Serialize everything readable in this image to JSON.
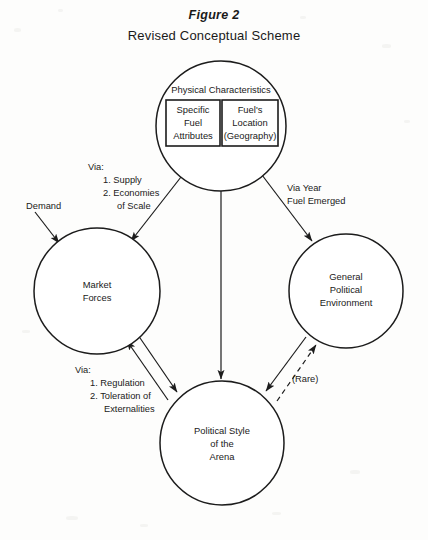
{
  "figure": {
    "label": "Figure 2",
    "subtitle": "Revised Conceptual Scheme"
  },
  "nodes": {
    "physical_characteristics": {
      "heading": "Physical Characteristics",
      "boxes": [
        {
          "lines": [
            "Specific",
            "Fuel",
            "Attributes"
          ]
        },
        {
          "lines": [
            "Fuel's",
            "Location",
            "(Geography)"
          ]
        }
      ]
    },
    "market_forces": {
      "lines": [
        "Market",
        "Forces"
      ]
    },
    "general_political_environment": {
      "lines": [
        "General",
        "Political",
        "Environment"
      ]
    },
    "political_style": {
      "lines": [
        "Political Style",
        "of the",
        "Arena"
      ]
    }
  },
  "edge_labels": {
    "demand": "Demand",
    "via_supply": {
      "lines": [
        "Via:",
        "1.  Supply",
        "2.  Economies",
        "of Scale"
      ]
    },
    "via_year": {
      "lines": [
        "Via Year",
        "Fuel Emerged"
      ]
    },
    "via_regulation": {
      "lines": [
        "Via:",
        "1.  Regulation",
        "2.  Toleration of",
        "Externalities"
      ]
    },
    "rare": "(Rare)"
  },
  "colors": {
    "ink": "#1c1c1c",
    "paper": "#fdfdfc"
  }
}
